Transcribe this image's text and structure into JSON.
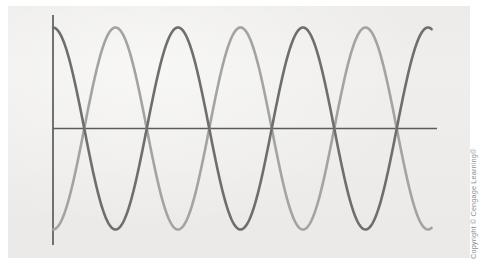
{
  "figure": {
    "background_color": "#ffffff",
    "plate_color": "#efeeec",
    "axis_color": "#5b5b5b",
    "credit_text": "Copyright © Cengage Learning®"
  },
  "chart_data": {
    "type": "line",
    "title": "",
    "subtitle": "",
    "xlabel": "",
    "ylabel": "",
    "grid": false,
    "legend": "none",
    "axes": {
      "x_axis": {
        "y_pixel": 128,
        "x_start": 53,
        "x_end": 437,
        "visible": true,
        "ticks": [],
        "tick_labels": []
      },
      "y_axis": {
        "x_pixel": 53,
        "y_start": 15,
        "y_end": 245,
        "visible": true,
        "ticks": [],
        "tick_labels": []
      },
      "xlim": [
        0,
        3.05
      ],
      "ylim": [
        -1.15,
        1.15
      ]
    },
    "x": [
      0,
      3.05
    ],
    "series": [
      {
        "name": "wave-1",
        "color": "#6e6e6e",
        "linewidth": 2.6,
        "form": "cosine",
        "amplitude": 1.0,
        "period": 1.0,
        "phase_deg": 0,
        "start_value": 1.0,
        "x_start_px": 53,
        "x_end_px": 432,
        "amplitude_px": 101,
        "period_px": 125,
        "phase_px": 0,
        "peaks_px": [
          53,
          178,
          303,
          428
        ],
        "troughs_px": [
          115.5,
          240.5,
          365.5
        ],
        "zero_crossings_px": [
          84.25,
          146.75,
          209.25,
          271.75,
          334.25,
          396.75
        ]
      },
      {
        "name": "wave-2",
        "color": "#a3a3a3",
        "linewidth": 2.6,
        "form": "negative-cosine",
        "amplitude": 1.0,
        "period": 1.0,
        "phase_deg": 180,
        "start_value": -1.0,
        "x_start_px": 53,
        "x_end_px": 432,
        "amplitude_px": 101,
        "period_px": 125,
        "phase_px": 62.5,
        "peaks_px": [
          115.5,
          240.5,
          365.5
        ],
        "troughs_px": [
          53,
          178,
          303,
          428
        ],
        "zero_crossings_px": [
          84.25,
          146.75,
          209.25,
          271.75,
          334.25,
          396.75
        ]
      }
    ]
  }
}
